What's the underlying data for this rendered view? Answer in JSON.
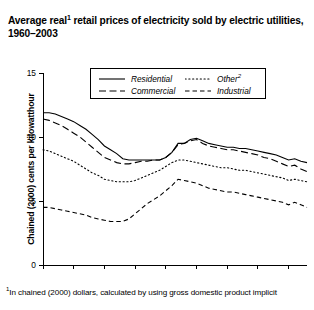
{
  "title": {
    "text_before": "Average real",
    "marker": "1",
    "text_after": " retail prices of electricity sold by electric utilities, 1960–2003"
  },
  "footnote": {
    "marker": "1",
    "text": "In chained (2000) dollars, calculated by using gross domestic product implicit"
  },
  "legend": {
    "items": [
      {
        "label": "Residential",
        "style": "solid",
        "sup": ""
      },
      {
        "label": "Commercial",
        "style": "long-dash",
        "sup": ""
      },
      {
        "label": "Other",
        "style": "dotted",
        "sup": "2"
      },
      {
        "label": "Industrial",
        "style": "dash",
        "sup": ""
      }
    ]
  },
  "chart_data": {
    "type": "line",
    "xlabel": "",
    "ylabel": "Chained (2000) cents per kilowatthour",
    "xlim": [
      1960,
      2003
    ],
    "ylim": [
      0,
      15
    ],
    "yticks": [
      0,
      5,
      10,
      15
    ],
    "xticks": [
      1960,
      1965,
      1970,
      1975,
      1980,
      1985,
      1990,
      1995,
      2000
    ],
    "grid": false,
    "legend_position": "top-center",
    "x": [
      1960,
      1961,
      1962,
      1963,
      1964,
      1965,
      1966,
      1967,
      1968,
      1969,
      1970,
      1971,
      1972,
      1973,
      1974,
      1975,
      1976,
      1977,
      1978,
      1979,
      1980,
      1981,
      1982,
      1983,
      1984,
      1985,
      1986,
      1987,
      1988,
      1989,
      1990,
      1991,
      1992,
      1993,
      1994,
      1995,
      1996,
      1997,
      1998,
      1999,
      2000,
      2001,
      2002,
      2003
    ],
    "series": [
      {
        "name": "Residential",
        "style": "solid",
        "values": [
          11.9,
          11.9,
          11.8,
          11.6,
          11.4,
          11.2,
          10.9,
          10.6,
          10.2,
          9.8,
          9.3,
          9.0,
          8.7,
          8.3,
          8.2,
          8.2,
          8.2,
          8.2,
          8.2,
          8.2,
          8.4,
          8.8,
          9.5,
          9.5,
          9.8,
          9.9,
          9.7,
          9.5,
          9.4,
          9.3,
          9.2,
          9.2,
          9.1,
          9.1,
          9.0,
          8.9,
          8.8,
          8.7,
          8.6,
          8.4,
          8.2,
          8.3,
          8.1,
          8.0
        ]
      },
      {
        "name": "Commercial",
        "style": "long-dash",
        "values": [
          11.4,
          11.3,
          11.1,
          10.9,
          10.6,
          10.3,
          10.0,
          9.6,
          9.2,
          8.8,
          8.4,
          8.2,
          8.0,
          7.9,
          7.9,
          8.0,
          8.1,
          8.1,
          8.2,
          8.2,
          8.4,
          8.8,
          9.4,
          9.5,
          9.7,
          9.8,
          9.5,
          9.3,
          9.2,
          9.1,
          9.0,
          9.0,
          8.9,
          8.8,
          8.7,
          8.6,
          8.4,
          8.3,
          8.1,
          7.9,
          7.7,
          7.8,
          7.5,
          7.3
        ]
      },
      {
        "name": "Other",
        "style": "dotted",
        "values": [
          9.0,
          8.9,
          8.7,
          8.5,
          8.3,
          8.1,
          7.8,
          7.5,
          7.2,
          7.0,
          6.7,
          6.6,
          6.5,
          6.5,
          6.5,
          6.6,
          6.8,
          7.0,
          7.2,
          7.4,
          7.7,
          8.0,
          8.2,
          8.2,
          8.1,
          8.0,
          7.9,
          7.8,
          7.7,
          7.6,
          7.6,
          7.5,
          7.4,
          7.4,
          7.3,
          7.2,
          7.1,
          7.0,
          6.9,
          6.8,
          6.6,
          6.7,
          6.6,
          6.5
        ]
      },
      {
        "name": "Industrial",
        "style": "dash",
        "values": [
          4.5,
          4.5,
          4.4,
          4.3,
          4.2,
          4.1,
          4.0,
          3.9,
          3.7,
          3.6,
          3.5,
          3.4,
          3.4,
          3.4,
          3.6,
          4.0,
          4.4,
          4.8,
          5.1,
          5.4,
          5.8,
          6.2,
          6.7,
          6.6,
          6.5,
          6.4,
          6.2,
          6.0,
          5.9,
          5.8,
          5.7,
          5.7,
          5.6,
          5.5,
          5.4,
          5.3,
          5.2,
          5.1,
          5.0,
          4.9,
          4.7,
          4.9,
          4.7,
          4.5
        ]
      }
    ]
  }
}
